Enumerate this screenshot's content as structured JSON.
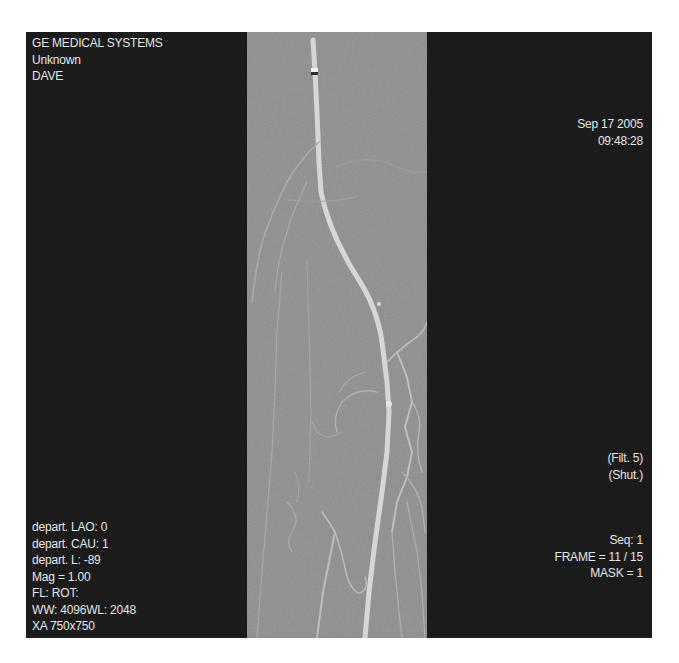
{
  "viewer": {
    "modality": "XA",
    "colors": {
      "background": "#ffffff",
      "panel": "#1b1b1b",
      "image_gray": "#8e8e8e",
      "text": "#e6e6e6",
      "vessel": "#d0d0d0"
    }
  },
  "overlay": {
    "top_left": {
      "manufacturer": "GE MEDICAL SYSTEMS",
      "patient_id": "Unknown",
      "patient_name": "DAVE"
    },
    "top_right": {
      "date": "Sep 17 2005",
      "time": "09:48:28"
    },
    "middle_right": {
      "filter": "(Filt. 5)",
      "shutter": "(Shut.)"
    },
    "bottom_left": {
      "lao": "depart. LAO: 0",
      "cau": "depart. CAU: 1",
      "l": "depart. L: -89",
      "mag": "Mag = 1.00",
      "fl_rot": "FL:  ROT:",
      "window": "WW: 4096WL: 2048",
      "matrix": "XA 750x750"
    },
    "bottom_right": {
      "seq": "Seq: 1",
      "frame": "FRAME = 11 / 15",
      "mask": "MASK = 1"
    }
  }
}
